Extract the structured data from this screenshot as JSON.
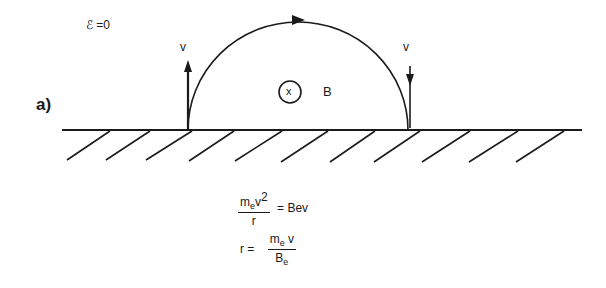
{
  "figure": {
    "part_label": "a)",
    "field_condition": "ℰ =0",
    "velocity_label_left": "v",
    "velocity_label_right": "v",
    "field_label": "B",
    "field_symbol": "x",
    "equations": {
      "eq1_numerator_m": "m",
      "eq1_numerator_sub": "e",
      "eq1_numerator_v": "v",
      "eq1_numerator_exp": "2",
      "eq1_denominator": "r",
      "eq1_rhs": "= Bev",
      "eq2_lhs": "r =",
      "eq2_numerator_m": "m",
      "eq2_numerator_sub": "e",
      "eq2_numerator_v": " v",
      "eq2_denominator_B": "B",
      "eq2_denominator_sub": "e"
    }
  }
}
